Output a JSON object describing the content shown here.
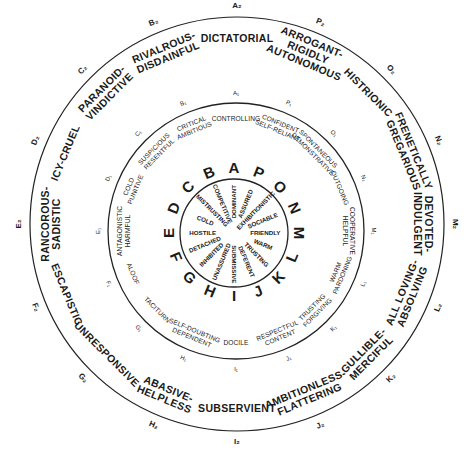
{
  "diagram": {
    "type": "interpersonal-circle",
    "center": [
      235,
      232
    ],
    "rings": {
      "outer": {
        "radius": 207,
        "center": [
          237,
          224
        ]
      },
      "middle": {
        "radius": 128,
        "center": [
          236,
          231
        ]
      },
      "inner": {
        "radius": 54,
        "center": [
          234,
          233
        ]
      }
    },
    "colors": {
      "ink": "#1a1a1a",
      "background": "#ffffff"
    },
    "octants": [
      {
        "letter": "A",
        "angle": -90,
        "inner": "DOMINANT",
        "middle_code": "A₁",
        "middle": [
          "CONTROLLING"
        ],
        "outer_code": "A₂",
        "outer": [
          "DICTATORIAL"
        ]
      },
      {
        "letter": "B",
        "angle": -112.5,
        "inner": "COMPETITIVE",
        "middle_code": "B₁",
        "middle": [
          "CRITICAL",
          "AMBITIOUS"
        ],
        "outer_code": "B₂",
        "outer": [
          "RIVALROUS-",
          "DISDAINFUL"
        ]
      },
      {
        "letter": "C",
        "angle": -135,
        "inner": "MISTRUSTING",
        "middle_code": "C₁",
        "middle": [
          "SUSPICIOUS",
          "RESENTFUL"
        ],
        "outer_code": "C₂",
        "outer": [
          "PARANOID-",
          "VINDICTIVE"
        ]
      },
      {
        "letter": "D",
        "angle": -157.5,
        "inner": "COLD",
        "middle_code": "D₁",
        "middle": [
          "COLD",
          "PUNITIVE"
        ],
        "outer_code": "D₂",
        "outer": [
          "ICY-CRUEL"
        ]
      },
      {
        "letter": "E",
        "angle": 180,
        "inner": "HOSTILE",
        "middle_code": "E₁",
        "middle": [
          "ANTAGONISTIC",
          "HARMFUL"
        ],
        "outer_code": "E₂",
        "outer": [
          "RANCOROUS-",
          "SADISTIC"
        ]
      },
      {
        "letter": "F",
        "angle": 157.5,
        "inner": "DETACHED",
        "middle_code": "F₁",
        "middle": [
          "ALOOF"
        ],
        "outer_code": "F₂",
        "outer": [
          "ESCAPISTIC"
        ]
      },
      {
        "letter": "G",
        "angle": 135,
        "inner": "INHIBITED",
        "middle_code": "G₁",
        "middle": [
          "TACITURN"
        ],
        "outer_code": "G₂",
        "outer": [
          "UNRESPONSIVE"
        ]
      },
      {
        "letter": "H",
        "angle": 112.5,
        "inner": "UNASSURED",
        "middle_code": "H₁",
        "middle": [
          "SELF-DOUBTING",
          "DEPENDENT"
        ],
        "outer_code": "H₂",
        "outer": [
          "ABASIVE-",
          "HELPLESS"
        ]
      },
      {
        "letter": "I",
        "angle": 90,
        "inner": "SUBMISSIVE",
        "middle_code": "I₁",
        "middle": [
          "DOCILE"
        ],
        "outer_code": "I₂",
        "outer": [
          "SUBSERVIENT"
        ]
      },
      {
        "letter": "J",
        "angle": 67.5,
        "inner": "DEFERENT",
        "middle_code": "J₁",
        "middle": [
          "RESPECTFUL",
          "CONTENT"
        ],
        "outer_code": "J₂",
        "outer": [
          "AMBITIONLESS-",
          "FLATTERING"
        ]
      },
      {
        "letter": "K",
        "angle": 45,
        "inner": "TRUSTING",
        "middle_code": "K₁",
        "middle": [
          "TRUSTING",
          "FORGIVING"
        ],
        "outer_code": "K₂",
        "outer": [
          "GULLIBLE-",
          "MERCIFUL"
        ]
      },
      {
        "letter": "L",
        "angle": 22.5,
        "inner": "WARM",
        "middle_code": "L₁",
        "middle": [
          "WARM",
          "PARDONING"
        ],
        "outer_code": "L₂",
        "outer": [
          "ALL LOVING-",
          "ABSOLVING"
        ]
      },
      {
        "letter": "M",
        "angle": 0,
        "inner": "FRIENDLY",
        "middle_code": "M₁",
        "middle": [
          "COOPERATIVE",
          "HELPFUL"
        ],
        "outer_code": "M₂",
        "outer": [
          "DEVOTED-",
          "INDULGENT"
        ]
      },
      {
        "letter": "N",
        "angle": -22.5,
        "inner": "SOCIABLE",
        "middle_code": "N₁",
        "middle": [
          "OUTGOING"
        ],
        "outer_code": "N₂",
        "outer": [
          "FRENETICALLY",
          "GREGARIOUS"
        ]
      },
      {
        "letter": "O",
        "angle": -45,
        "inner": "EXHIBITIONISTIC",
        "middle_code": "O₁",
        "middle": [
          "SPONTANEOUS",
          "DEMONSTRATIVE"
        ],
        "outer_code": "O₂",
        "outer": [
          "HISTRIONIC"
        ]
      },
      {
        "letter": "P",
        "angle": -67.5,
        "inner": "ASSURED",
        "middle_code": "P₁",
        "middle": [
          "CONFIDENT",
          "SELF-RELIANT"
        ],
        "outer_code": "P₂",
        "outer": [
          "ARROGANT-",
          "RIGIDLY",
          "AUTONOMOUS"
        ]
      }
    ]
  }
}
